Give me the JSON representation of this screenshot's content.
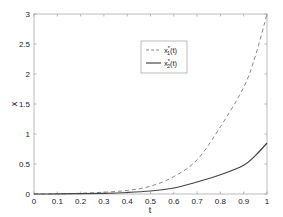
{
  "chart_data": {
    "type": "line",
    "title": "",
    "xlabel": "t",
    "ylabel": "x",
    "xlim": [
      0,
      1
    ],
    "ylim": [
      0,
      3
    ],
    "grid": false,
    "legend_position": "upper center",
    "x_ticks": [
      "0",
      "0.1",
      "0.2",
      "0.3",
      "0.4",
      "0.5",
      "0.6",
      "0.7",
      "0.8",
      "0.9",
      "1"
    ],
    "y_ticks": [
      "0",
      "0.5",
      "1",
      "1.5",
      "2",
      "2.5",
      "3"
    ],
    "x": [
      0,
      0.1,
      0.2,
      0.3,
      0.4,
      0.5,
      0.6,
      0.7,
      0.8,
      0.9,
      0.95,
      1.0
    ],
    "series": [
      {
        "name": "x1*(t)",
        "label_main": "x",
        "label_sup": "*",
        "label_sub": "1",
        "label_tail": "(t)",
        "style": "dashed",
        "color": "#888888",
        "values": [
          0,
          0.003,
          0.012,
          0.03,
          0.06,
          0.13,
          0.29,
          0.57,
          1.12,
          1.78,
          2.3,
          3.0
        ]
      },
      {
        "name": "x2*(t)",
        "label_main": "x",
        "label_sup": "*",
        "label_sub": "2",
        "label_tail": "(t)",
        "style": "solid",
        "color": "#444444",
        "values": [
          0,
          0.001,
          0.005,
          0.012,
          0.025,
          0.05,
          0.1,
          0.2,
          0.32,
          0.48,
          0.64,
          0.85
        ]
      }
    ]
  }
}
